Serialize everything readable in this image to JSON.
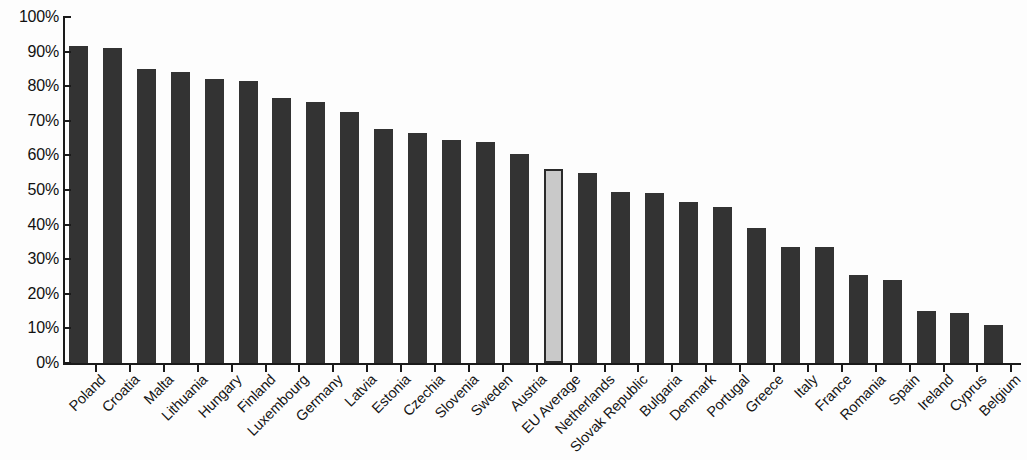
{
  "chart_data": {
    "type": "bar",
    "title": "",
    "subtitle": "",
    "xlabel": "",
    "ylabel": "",
    "ylim": [
      0,
      100
    ],
    "grid": false,
    "legend": null,
    "y_tick_labels": [
      "100%",
      "90%",
      "80%",
      "70%",
      "60%",
      "50%",
      "40%",
      "30%",
      "20%",
      "10%",
      "0%"
    ],
    "y_tick_values": [
      100,
      90,
      80,
      70,
      60,
      50,
      40,
      30,
      20,
      10,
      0
    ],
    "value_unit": "%",
    "categories": [
      "Poland",
      "Croatia",
      "Malta",
      "Lithuania",
      "Hungary",
      "Finland",
      "Luxembourg",
      "Germany",
      "Latvia",
      "Estonia",
      "Czechia",
      "Slovenia",
      "Sweden",
      "Austria",
      "EU Average",
      "Netherlands",
      "Slovak Republic",
      "Bulgaria",
      "Denmark",
      "Portugal",
      "Greece",
      "Italy",
      "France",
      "Romania",
      "Spain",
      "Ireland",
      "Cyprus",
      "Belgium"
    ],
    "values": [
      91.5,
      91.0,
      85.0,
      84.0,
      82.0,
      81.5,
      76.5,
      75.5,
      72.5,
      67.5,
      66.5,
      64.5,
      64.0,
      60.5,
      56.0,
      55.0,
      49.5,
      49.0,
      46.5,
      45.0,
      39.0,
      33.5,
      33.5,
      25.5,
      24.0,
      15.0,
      14.5,
      11.0
    ],
    "highlight_category": "EU Average",
    "colors": {
      "bar": "#333333",
      "highlight_bar": "#c9c9c9",
      "highlight_outline": "#2a2a2a",
      "axis": "#1a1a1a",
      "text": "#111111",
      "background": "#fdfdfd"
    }
  }
}
